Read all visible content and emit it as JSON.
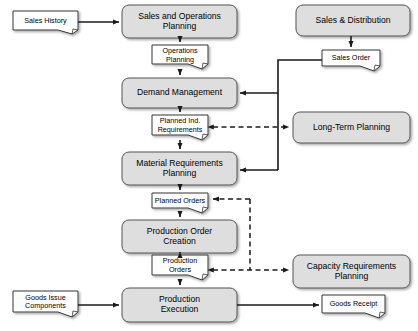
{
  "diagram": {
    "type": "flowchart",
    "width": 418,
    "height": 331,
    "background": "#ffffff",
    "style": {
      "process_fill": "#dedede",
      "process_stroke": "#555555",
      "document_fill": "#ffffff",
      "document_stroke": "#333333",
      "connector_solid": "#1a1a1a",
      "connector_dashed": "#1a1a1a"
    }
  },
  "nodes": {
    "sales_history": {
      "label": "Sales History",
      "shape": "document",
      "x": 13,
      "y": 11,
      "w": 65,
      "h": 23
    },
    "sales_and_operations_planning": {
      "label": "Sales and Operations\nPlanning",
      "shape": "process",
      "x": 122,
      "y": 5,
      "w": 115,
      "h": 33
    },
    "sales_and_distribution": {
      "label": "Sales & Distribution",
      "shape": "process",
      "x": 296,
      "y": 5,
      "w": 114,
      "h": 31
    },
    "operations_planning": {
      "label": "Operations\nPlanning",
      "shape": "document",
      "x": 152,
      "y": 45,
      "w": 56,
      "h": 24
    },
    "sales_order": {
      "label": "Sales Order",
      "shape": "document",
      "x": 322,
      "y": 50,
      "w": 58,
      "h": 21
    },
    "demand_management": {
      "label": "Demand Management",
      "shape": "process",
      "x": 122,
      "y": 78,
      "w": 115,
      "h": 30
    },
    "planned_ind_requirements": {
      "label": "Planned Ind.\nRequirements",
      "shape": "document",
      "x": 152,
      "y": 115,
      "w": 56,
      "h": 25
    },
    "long_term_planning": {
      "label": "Long-Term Planning",
      "shape": "process",
      "x": 293,
      "y": 112,
      "w": 117,
      "h": 31
    },
    "material_requirements_planning": {
      "label": "Material Requirements\nPlanning",
      "shape": "process",
      "x": 122,
      "y": 152,
      "w": 115,
      "h": 33
    },
    "planned_orders": {
      "label": "Planned Orders",
      "shape": "document",
      "x": 152,
      "y": 193,
      "w": 56,
      "h": 20
    },
    "production_order_creation": {
      "label": "Production Order\nCreation",
      "shape": "process",
      "x": 122,
      "y": 220,
      "w": 115,
      "h": 33
    },
    "production_orders": {
      "label": "Production\nOrders",
      "shape": "document",
      "x": 152,
      "y": 255,
      "w": 56,
      "h": 25
    },
    "capacity_requirements_planning": {
      "label": "Capacity Requirements\nPlanning",
      "shape": "process",
      "x": 293,
      "y": 255,
      "w": 117,
      "h": 33
    },
    "goods_issue_components": {
      "label": "Goods Issue\nComponents",
      "shape": "document",
      "x": 13,
      "y": 291,
      "w": 65,
      "h": 26
    },
    "production_execution": {
      "label": "Production\nExecution",
      "shape": "process",
      "x": 122,
      "y": 288,
      "w": 115,
      "h": 34
    },
    "goods_receipt": {
      "label": "Goods Receipt",
      "shape": "document",
      "x": 322,
      "y": 295,
      "w": 63,
      "h": 23
    }
  },
  "edges": [
    {
      "name": "sales-history-to-sop",
      "from": "sales_history",
      "to": "sales_and_operations_planning",
      "style": "solid",
      "arrows": "end"
    },
    {
      "name": "sop-to-operations-planning",
      "from": "sales_and_operations_planning",
      "to": "operations_planning",
      "style": "solid",
      "arrows": "end"
    },
    {
      "name": "operations-planning-to-demand-management",
      "from": "operations_planning",
      "to": "demand_management",
      "style": "solid",
      "arrows": "end"
    },
    {
      "name": "demand-management-to-planned-ind-requirements",
      "from": "demand_management",
      "to": "planned_ind_requirements",
      "style": "solid",
      "arrows": "end"
    },
    {
      "name": "planned-ind-requirements-to-mrp",
      "from": "planned_ind_requirements",
      "to": "material_requirements_planning",
      "style": "solid",
      "arrows": "end"
    },
    {
      "name": "mrp-to-planned-orders",
      "from": "material_requirements_planning",
      "to": "planned_orders",
      "style": "solid",
      "arrows": "end"
    },
    {
      "name": "planned-orders-to-production-order-creation",
      "from": "planned_orders",
      "to": "production_order_creation",
      "style": "solid",
      "arrows": "end"
    },
    {
      "name": "production-order-creation-to-production-orders",
      "from": "production_order_creation",
      "to": "production_orders",
      "style": "solid",
      "arrows": "end"
    },
    {
      "name": "production-orders-to-production-execution",
      "from": "production_orders",
      "to": "production_execution",
      "style": "solid",
      "arrows": "end"
    },
    {
      "name": "sales-distribution-to-sales-order",
      "from": "sales_and_distribution",
      "to": "sales_order",
      "style": "solid",
      "arrows": "end"
    },
    {
      "name": "sales-order-to-demand-management",
      "from": "sales_order",
      "to": "demand_management",
      "style": "solid",
      "arrows": "end"
    },
    {
      "name": "sales-order-to-mrp",
      "from": "sales_order",
      "to": "material_requirements_planning",
      "style": "solid",
      "arrows": "end"
    },
    {
      "name": "planned-ind-requirements-long-term-planning",
      "from": "planned_ind_requirements",
      "to": "long_term_planning",
      "style": "dashed",
      "arrows": "both"
    },
    {
      "name": "planned-orders-capacity-link",
      "from": "planned_orders",
      "to": "capacity_requirements_planning",
      "style": "dashed",
      "arrows": "start"
    },
    {
      "name": "production-orders-capacity-link",
      "from": "production_orders",
      "to": "capacity_requirements_planning",
      "style": "dashed",
      "arrows": "both"
    },
    {
      "name": "goods-issue-to-production-execution",
      "from": "goods_issue_components",
      "to": "production_execution",
      "style": "solid",
      "arrows": "end"
    },
    {
      "name": "production-execution-to-goods-receipt",
      "from": "production_execution",
      "to": "goods_receipt",
      "style": "solid",
      "arrows": "end"
    }
  ]
}
